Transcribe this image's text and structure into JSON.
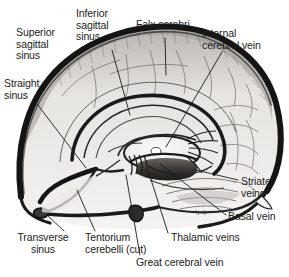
{
  "figure": {
    "type": "anatomical-illustration",
    "orientation": "anterior to the left, posterior to the right",
    "style": "grayscale pen-and-ink medical illustration with leader lines"
  },
  "labels": [
    {
      "id": "superior-sagittal-sinus",
      "text": "Superior\nsagittal\nsinus",
      "x": 16,
      "y": 27,
      "leader": {
        "x1": 66,
        "y1": 62,
        "x2": 82,
        "y2": 47
      }
    },
    {
      "id": "inferior-sagittal-sinus",
      "text": "Inferior\nsagittal\nsinus",
      "x": 76,
      "y": 8,
      "leader": {
        "x1": 112,
        "y1": 50,
        "x2": 130,
        "y2": 115
      }
    },
    {
      "id": "falx-cerebri",
      "text": "Falx cerebri",
      "x": 136,
      "y": 19,
      "leader": {
        "x1": 165,
        "y1": 38,
        "x2": 166,
        "y2": 75
      }
    },
    {
      "id": "internal-cerebral-vein",
      "text": "Internal\ncerebral vein",
      "x": 202,
      "y": 28,
      "leader": {
        "x1": 222,
        "y1": 52,
        "x2": 166,
        "y2": 147
      }
    },
    {
      "id": "straight-sinus",
      "text": "Straight\nsinus",
      "x": 4,
      "y": 78,
      "leader": {
        "x1": 34,
        "y1": 100,
        "x2": 86,
        "y2": 168
      }
    },
    {
      "id": "striate-veins",
      "text": "Striate\nveins",
      "x": 241,
      "y": 176,
      "leader": {
        "x1": 238,
        "y1": 180,
        "x2": 196,
        "y2": 170
      }
    },
    {
      "id": "basal-vein",
      "text": "Basal vein",
      "x": 228,
      "y": 211,
      "leader": {
        "x1": 226,
        "y1": 215,
        "x2": 160,
        "y2": 164
      }
    },
    {
      "id": "thalamic-veins",
      "text": "Thalamic veins",
      "x": 171,
      "y": 232,
      "leader": {
        "x1": 168,
        "y1": 233,
        "x2": 148,
        "y2": 170
      }
    },
    {
      "id": "great-cerebral-vein",
      "text": "Great cerebral vein",
      "x": 136,
      "y": 257,
      "leader": {
        "x1": 140,
        "y1": 255,
        "x2": 126,
        "y2": 175
      }
    },
    {
      "id": "transverse-sinus",
      "text": "Transverse\nsinus",
      "x": 6,
      "y": 232,
      "leader": {
        "x1": 64,
        "y1": 231,
        "x2": 46,
        "y2": 214
      }
    },
    {
      "id": "tentorium-cerebelli-cut",
      "text": "Tentorium\ncerebelli (cut)",
      "x": 85,
      "y": 232,
      "leader": {
        "x1": 95,
        "y1": 231,
        "x2": 77,
        "y2": 190
      }
    }
  ],
  "colors": {
    "background": "#ffffff",
    "text": "#1c1c1c",
    "leader_line": "#1a1a1a",
    "dura_outline": "#141414",
    "brain_fill": "#f2f1ef",
    "brain_shade": "#cfcdc9",
    "vein_stroke": "#2a2a2a",
    "sulcus_stroke": "#5a5754"
  }
}
